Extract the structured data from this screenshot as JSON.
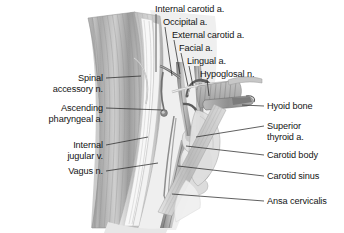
{
  "figure": {
    "background_color": "#ffffff",
    "text_color": "#141414",
    "leader_color": "#2b2b2b",
    "width": 344,
    "height": 233
  },
  "labels": {
    "top": [
      {
        "name": "internal-carotid-a",
        "text": "Internal carotid a.",
        "x": 155,
        "y": 4,
        "align": "left"
      },
      {
        "name": "occipital-a",
        "text": "Occipital a.",
        "x": 163,
        "y": 17,
        "align": "left"
      },
      {
        "name": "external-carotid-a",
        "text": "External carotid a.",
        "x": 172,
        "y": 30,
        "align": "left"
      },
      {
        "name": "facial-a",
        "text": "Facial a.",
        "x": 179,
        "y": 43,
        "align": "left"
      },
      {
        "name": "lingual-a",
        "text": "Lingual a.",
        "x": 187,
        "y": 56,
        "align": "left"
      },
      {
        "name": "hypoglosal-n",
        "text": "Hypoglosal n.",
        "x": 200,
        "y": 69,
        "align": "left"
      }
    ],
    "left": [
      {
        "name": "spinal-accessory-n",
        "line1": "Spinal",
        "line2": "accessory n.",
        "right": 103,
        "y": 73
      },
      {
        "name": "ascending-pharyngeal-a",
        "line1": "Ascending",
        "line2": "pharyngeal a.",
        "right": 103,
        "y": 103
      },
      {
        "name": "internal-jugular-v",
        "line1": "Internal",
        "line2": "jugular v.",
        "right": 103,
        "y": 140
      },
      {
        "name": "vagus-n",
        "line1": "Vagus n.",
        "line2": "",
        "right": 103,
        "y": 166
      }
    ],
    "right": [
      {
        "name": "hyoid-bone",
        "line1": "Hyoid bone",
        "line2": "",
        "x": 267,
        "y": 102
      },
      {
        "name": "superior-thyroid-a",
        "line1": "Superior",
        "line2": "thyroid a.",
        "x": 267,
        "y": 122
      },
      {
        "name": "carotid-body",
        "line1": "Carotid body",
        "line2": "",
        "x": 267,
        "y": 151
      },
      {
        "name": "carotid-sinus",
        "line1": "Carotid sinus",
        "line2": "",
        "x": 267,
        "y": 172
      },
      {
        "name": "ansa-cervicalis",
        "line1": "Ansa cervicalis",
        "line2": "",
        "x": 267,
        "y": 197
      }
    ]
  }
}
